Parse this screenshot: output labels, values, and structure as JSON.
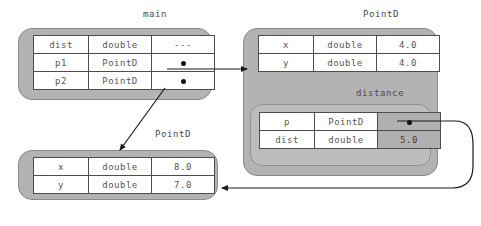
{
  "diagram": {
    "background": "#ffffff",
    "frame_fill": "#b3b3b3",
    "inner_frame_fill": "#bdbdbd",
    "table_fill": "#ffffff",
    "shaded_cell_fill": "#b0b0b0",
    "line_color": "#1a1a1a",
    "text_color": "#555555"
  },
  "frames": [
    {
      "id": "main",
      "label": "main",
      "rows": [
        {
          "name": "dist",
          "type": "double",
          "value": "---",
          "value_kind": "text",
          "shaded": false
        },
        {
          "name": "p1",
          "type": "PointD",
          "value": "",
          "value_kind": "pointer",
          "shaded": false
        },
        {
          "name": "p2",
          "type": "PointD",
          "value": "",
          "value_kind": "pointer",
          "shaded": false
        }
      ]
    },
    {
      "id": "pointd-top",
      "label": "PointD",
      "rows": [
        {
          "name": "x",
          "type": "double",
          "value": "4.0",
          "value_kind": "text",
          "shaded": false
        },
        {
          "name": "y",
          "type": "double",
          "value": "4.0",
          "value_kind": "text",
          "shaded": false
        }
      ]
    },
    {
      "id": "distance",
      "label": "distance",
      "rows": [
        {
          "name": "p",
          "type": "PointD",
          "value": "",
          "value_kind": "pointer",
          "shaded": true
        },
        {
          "name": "dist",
          "type": "double",
          "value": "5.0",
          "value_kind": "text",
          "shaded": true
        }
      ]
    },
    {
      "id": "pointd-bottom",
      "label": "PointD",
      "rows": [
        {
          "name": "x",
          "type": "double",
          "value": "8.0",
          "value_kind": "text",
          "shaded": false
        },
        {
          "name": "y",
          "type": "double",
          "value": "7.0",
          "value_kind": "text",
          "shaded": false
        }
      ]
    }
  ],
  "arrows": [
    {
      "id": "p1-to-pointd-top",
      "from": "main.p1",
      "to": "pointd-top",
      "style": "straight-right"
    },
    {
      "id": "p2-to-pointd-bottom",
      "from": "main.p2",
      "to": "pointd-bottom",
      "style": "diagonal-down-left"
    },
    {
      "id": "distance-p-to-pointd-bottom",
      "from": "distance.p",
      "to": "pointd-bottom",
      "style": "curved-loop-left"
    }
  ]
}
